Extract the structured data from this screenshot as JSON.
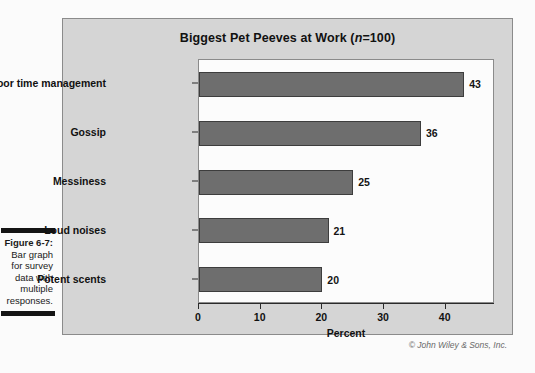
{
  "caption": {
    "figure_number": "Figure 6-7:",
    "lines": [
      "Bar graph",
      "for survey",
      "data with",
      "multiple",
      "responses."
    ]
  },
  "copyright": "© John Wiley & Sons, Inc.",
  "colors": {
    "bar_fill": "#6e6e6e",
    "bar_border": "#3d3d3d",
    "chart_background": "#d5d5d5",
    "plot_background": "#fcfcfc",
    "frame_border": "#8b8b8b",
    "text": "#111111"
  },
  "chart_data": {
    "type": "bar",
    "orientation": "horizontal",
    "title": "Biggest Pet Peeves at Work (n=100)",
    "title_prefix": "Biggest Pet Peeves at Work (",
    "title_italic": "n",
    "title_suffix": "=100)",
    "categories": [
      "Poor time management",
      "Gossip",
      "Messiness",
      "Loud noises",
      "Potent scents"
    ],
    "values": [
      43,
      36,
      25,
      21,
      20
    ],
    "data_labels": [
      "43",
      "36",
      "25",
      "21",
      "20"
    ],
    "xlabel": "Percent",
    "ylabel": "",
    "xlim": [
      0,
      48
    ],
    "xticks": [
      0,
      10,
      20,
      30,
      40
    ],
    "xtick_labels": [
      "0",
      "10",
      "20",
      "30",
      "40"
    ],
    "grid": false,
    "legend": false
  }
}
